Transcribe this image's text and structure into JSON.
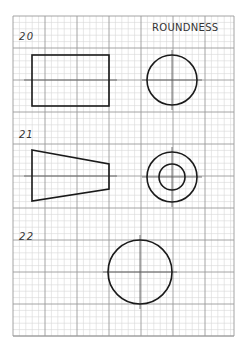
{
  "title": "ROUNDNESS",
  "grid": {
    "x0": 13,
    "y0": 16,
    "x1": 234,
    "y1": 336,
    "major": 32,
    "minor_divisions": 5,
    "major_color": "#9a9a9a",
    "minor_color": "#d6d6d6"
  },
  "exercises": [
    {
      "number": "20",
      "front_view": {
        "shape": "rectangle",
        "x": 32,
        "y": 55,
        "w": 77,
        "h": 51
      },
      "side_view": {
        "shape": "circle",
        "cx": 172,
        "cy": 80,
        "r": 25
      },
      "centerline_y": 80
    },
    {
      "number": "21",
      "front_view": {
        "shape": "trapezoid",
        "points": "32,150 109,164 109,189 32,201"
      },
      "side_view": {
        "shape": "concentric-circles",
        "cx": 172,
        "cy": 177,
        "r_outer": 25,
        "r_inner": 13
      },
      "centerline_y": 176
    },
    {
      "number": "22",
      "side_view": {
        "shape": "circle",
        "cx": 140,
        "cy": 272,
        "r": 32
      },
      "centerline_y": 272
    }
  ],
  "line_color": "#1a1a1a"
}
